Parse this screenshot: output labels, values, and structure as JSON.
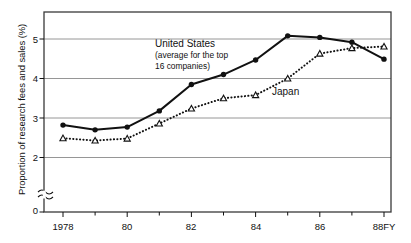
{
  "chart_data": {
    "type": "line",
    "title": "",
    "xlabel": "",
    "ylabel": "Proportion of research fees and sales (%)",
    "x": [
      1978,
      1979,
      1980,
      1981,
      1982,
      1983,
      1984,
      1985,
      1986,
      1987,
      1988
    ],
    "categories": [
      "1978",
      "79",
      "80",
      "81",
      "82",
      "83",
      "84",
      "85",
      "86",
      "87",
      "88FY"
    ],
    "xtick_labels": [
      "1978",
      "80",
      "82",
      "84",
      "86",
      "88FY"
    ],
    "xtick_values": [
      1978,
      1980,
      1982,
      1984,
      1986,
      1988
    ],
    "ytick_labels": [
      "0",
      "2",
      "3",
      "4",
      "5"
    ],
    "ytick_values": [
      0,
      2,
      3,
      4,
      5
    ],
    "ylim": [
      0,
      5.5
    ],
    "xlim": [
      1977.4,
      1988.6
    ],
    "grid": true,
    "grid_axis": "y",
    "axis_break": true,
    "axis_break_note": "~",
    "legend_position": "inline-annotation",
    "series": [
      {
        "name": "United States",
        "label_line1": "United States",
        "label_line2": "(average for the top",
        "label_line3": "16 companies)",
        "marker": "filled-circle",
        "linestyle": "solid",
        "color": "#111111",
        "values": [
          2.82,
          2.7,
          2.77,
          3.18,
          3.85,
          4.1,
          4.47,
          5.08,
          5.04,
          4.92,
          4.49
        ]
      },
      {
        "name": "Japan",
        "label_line1": "Japan",
        "marker": "open-triangle",
        "linestyle": "dotted",
        "color": "#111111",
        "values": [
          2.49,
          2.43,
          2.48,
          2.86,
          3.24,
          3.5,
          3.58,
          4.0,
          4.63,
          4.77,
          4.81
        ]
      }
    ]
  },
  "axis": {
    "y_title": "Proportion of research fees and sales (%)",
    "y_ticks": [
      {
        "label": "5",
        "value": 5
      },
      {
        "label": "4",
        "value": 4
      },
      {
        "label": "3",
        "value": 3
      },
      {
        "label": "2",
        "value": 2
      },
      {
        "label": "0",
        "value": 0
      }
    ],
    "x_ticks": [
      {
        "label": "1978",
        "value": 1978
      },
      {
        "label": "80",
        "value": 1980
      },
      {
        "label": "82",
        "value": 1982
      },
      {
        "label": "84",
        "value": 1984
      },
      {
        "label": "86",
        "value": 1986
      },
      {
        "label": "88FY",
        "value": 1988
      }
    ]
  },
  "annotations": {
    "us": {
      "line1": "United States",
      "line2": "(average for the top",
      "line3": "16 companies)"
    },
    "japan": {
      "line1": "Japan"
    }
  },
  "colors": {
    "ink": "#111111",
    "grid": "#8a8a8a",
    "frame": "#3a3a3a",
    "background": "#ffffff"
  }
}
